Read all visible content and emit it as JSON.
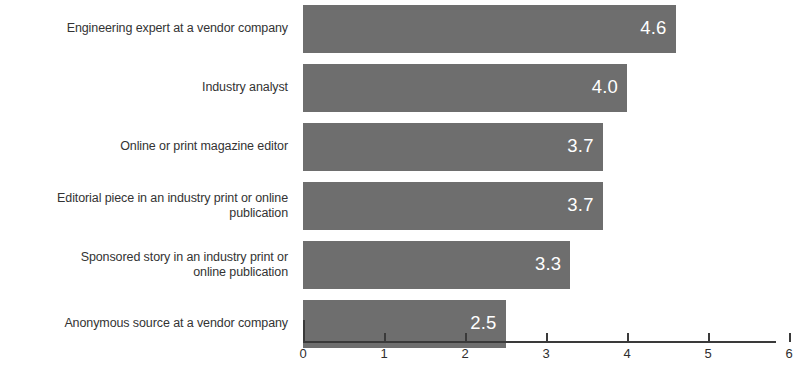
{
  "chart_data": {
    "type": "bar",
    "orientation": "horizontal",
    "title": "",
    "subtitle": "",
    "xlabel": "",
    "ylabel": "",
    "xlim": [
      0,
      6
    ],
    "grid": false,
    "legend": null,
    "bar_color": "#6e6e6e",
    "label_color": "#333333",
    "value_label_color": "#ffffff",
    "axis_color": "#3a3a3a",
    "xticks": [
      "0",
      "1",
      "2",
      "3",
      "4",
      "5",
      "6"
    ],
    "categories": [
      "Engineering expert at a vendor company",
      "Industry analyst",
      "Online or print magazine editor",
      "Editorial piece in an industry print or online publication",
      "Sponsored story in an industry print or online publication",
      "Anonymous source at a vendor company"
    ],
    "category_lines": [
      [
        "Engineering expert at a vendor company"
      ],
      [
        "Industry analyst"
      ],
      [
        "Online or print magazine editor"
      ],
      [
        "Editorial piece in an industry print or online",
        "publication"
      ],
      [
        "Sponsored story in an industry print or",
        "online publication"
      ],
      [
        "Anonymous source at a vendor company"
      ]
    ],
    "values": [
      4.6,
      4.0,
      3.7,
      3.7,
      3.3,
      2.5
    ],
    "value_labels": [
      "4.6",
      "4.0",
      "3.7",
      "3.7",
      "3.3",
      "2.5"
    ]
  }
}
